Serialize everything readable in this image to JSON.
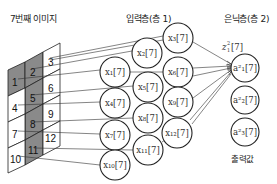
{
  "image_title": "7번째 이미지",
  "input_layer": {
    "title": "입력층(층 1)",
    "nodes": [
      {
        "id": "x1",
        "label": "x₁[7]",
        "cx": 115,
        "cy": 72
      },
      {
        "id": "x2",
        "label": "x₂[7]",
        "cx": 147,
        "cy": 53
      },
      {
        "id": "x3",
        "label": "x₃[7]",
        "cx": 178,
        "cy": 38
      },
      {
        "id": "x4",
        "label": "x₄[7]",
        "cx": 115,
        "cy": 103
      },
      {
        "id": "x5",
        "label": "x₅[7]",
        "cx": 148,
        "cy": 87
      },
      {
        "id": "x6",
        "label": "x₆[7]",
        "cx": 178,
        "cy": 72
      },
      {
        "id": "x7",
        "label": "x₇[7]",
        "cx": 115,
        "cy": 135
      },
      {
        "id": "x8",
        "label": "x₈[7]",
        "cx": 148,
        "cy": 118
      },
      {
        "id": "x9",
        "label": "x₉[7]",
        "cx": 178,
        "cy": 102
      },
      {
        "id": "x10",
        "label": "x₁₀[7]",
        "cx": 115,
        "cy": 165
      },
      {
        "id": "x11",
        "label": "x₁₁[7]",
        "cx": 148,
        "cy": 150
      },
      {
        "id": "x12",
        "label": "x₁₂[7]",
        "cx": 177,
        "cy": 133
      }
    ]
  },
  "hidden_layer": {
    "title": "은닉층(층 2)",
    "weighted_input_label": "z²₁[7]",
    "nodes": [
      {
        "id": "a1",
        "label": "a²₁[7]",
        "cx": 245,
        "cy": 68
      },
      {
        "id": "a2",
        "label": "a²₂[7]",
        "cx": 245,
        "cy": 100
      },
      {
        "id": "a3",
        "label": "a²₃[7]",
        "cx": 245,
        "cy": 132
      }
    ],
    "output_caption": "출력값"
  },
  "image_grid": {
    "cells": [
      "1",
      "2",
      "3",
      "4",
      "5",
      "6",
      "7",
      "8",
      "9",
      "10",
      "11",
      "12"
    ],
    "shaded_cells": [
      "1",
      "2",
      "5",
      "8",
      "11"
    ]
  },
  "colors": {
    "shaded": "#8a8a8a",
    "stroke": "#222222",
    "background": "#ffffff"
  }
}
